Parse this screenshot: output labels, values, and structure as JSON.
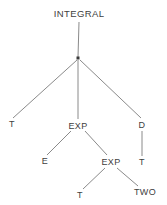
{
  "figure": {
    "width": 167,
    "height": 205,
    "background_color": "#ffffff",
    "line_color": "#8a8a8a",
    "text_color": "#404040",
    "node_dot_color": "#3a3a3a"
  },
  "nodes": [
    {
      "id": "root_label",
      "label": "INTEGRAL",
      "x": 79,
      "y": 14,
      "kind": "label"
    },
    {
      "id": "junction",
      "label": "",
      "x": 78,
      "y": 58,
      "kind": "dot"
    },
    {
      "id": "t1",
      "label": "T",
      "x": 12,
      "y": 124,
      "kind": "label"
    },
    {
      "id": "exp1",
      "label": "EXP",
      "x": 78,
      "y": 126,
      "kind": "label"
    },
    {
      "id": "d1",
      "label": "D",
      "x": 142,
      "y": 125,
      "kind": "label"
    },
    {
      "id": "e1",
      "label": "E",
      "x": 45,
      "y": 161,
      "kind": "label"
    },
    {
      "id": "exp2",
      "label": "EXP",
      "x": 111,
      "y": 162,
      "kind": "label"
    },
    {
      "id": "t2",
      "label": "T",
      "x": 142,
      "y": 162,
      "kind": "label"
    },
    {
      "id": "t3",
      "label": "T",
      "x": 80,
      "y": 195,
      "kind": "label"
    },
    {
      "id": "two1",
      "label": "TWO",
      "x": 145,
      "y": 192,
      "kind": "label"
    }
  ],
  "edges": [
    {
      "from": "root_label",
      "to": "junction",
      "x1": 79,
      "y1": 22,
      "x2": 78,
      "y2": 57
    },
    {
      "from": "junction",
      "to": "t1",
      "x1": 77,
      "y1": 60,
      "x2": 13,
      "y2": 118
    },
    {
      "from": "junction",
      "to": "exp1",
      "x1": 78,
      "y1": 60,
      "x2": 78,
      "y2": 119
    },
    {
      "from": "junction",
      "to": "d1",
      "x1": 80,
      "y1": 60,
      "x2": 141,
      "y2": 118
    },
    {
      "from": "exp1",
      "to": "e1",
      "x1": 71,
      "y1": 131,
      "x2": 47,
      "y2": 155
    },
    {
      "from": "exp1",
      "to": "exp2",
      "x1": 85,
      "y1": 131,
      "x2": 107,
      "y2": 155
    },
    {
      "from": "d1",
      "to": "t2",
      "x1": 142,
      "y1": 131,
      "x2": 142,
      "y2": 156
    },
    {
      "from": "exp2",
      "to": "t3",
      "x1": 105,
      "y1": 168,
      "x2": 83,
      "y2": 189
    },
    {
      "from": "exp2",
      "to": "two1",
      "x1": 117,
      "y1": 168,
      "x2": 138,
      "y2": 186
    }
  ]
}
